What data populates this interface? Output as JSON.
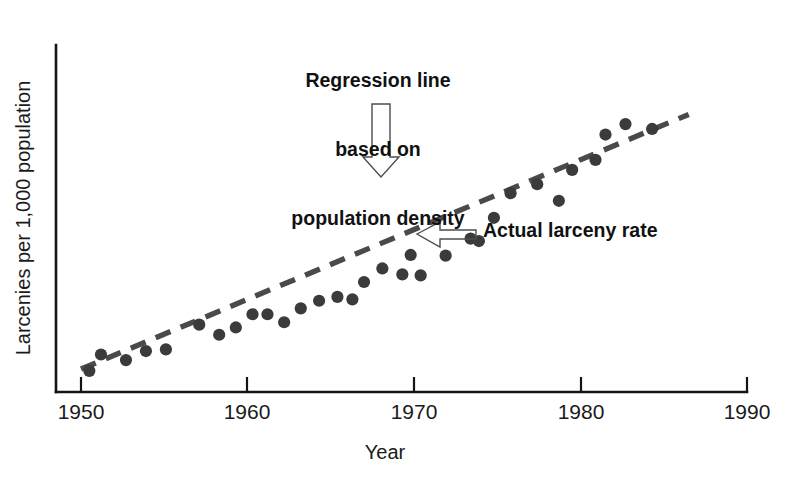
{
  "chart_data": {
    "type": "scatter",
    "title": "",
    "xlabel": "Year",
    "ylabel": "Larcenies per 1,000 population",
    "xlim": [
      1950,
      1990
    ],
    "ylim": [
      0,
      10
    ],
    "grid": false,
    "legend_position": "none",
    "x_ticks": [
      "1950",
      "1960",
      "1970",
      "1980",
      "1990"
    ],
    "x_tick_values": [
      1950,
      1960,
      1970,
      1980,
      1990
    ],
    "y_ticks": [],
    "series": [
      {
        "name": "Actual larceny rate",
        "marker": "filled-circle",
        "color": "#3b3b3b",
        "x": [
          1950.5,
          1951.2,
          1952.7,
          1953.9,
          1955.1,
          1957.1,
          1958.3,
          1959.3,
          1960.3,
          1961.2,
          1962.2,
          1963.2,
          1964.3,
          1965.4,
          1966.3,
          1967.0,
          1968.1,
          1969.3,
          1969.8,
          1970.4,
          1971.9,
          1973.4,
          1973.9,
          1974.8,
          1975.8,
          1977.4,
          1978.7,
          1979.5,
          1980.9,
          1981.5,
          1982.7,
          1984.3
        ],
        "y": [
          0.61,
          1.08,
          0.92,
          1.18,
          1.23,
          1.94,
          1.65,
          1.86,
          2.24,
          2.24,
          2.01,
          2.41,
          2.63,
          2.74,
          2.67,
          3.17,
          3.56,
          3.39,
          3.95,
          3.36,
          3.93,
          4.42,
          4.35,
          5.02,
          5.73,
          5.99,
          5.51,
          6.4,
          6.69,
          7.42,
          7.72,
          7.58
        ]
      }
    ],
    "trendline": {
      "name": "Regression line based on population density",
      "style": "dashed",
      "color": "#4a4a4a",
      "x_start": 1950.0,
      "x_end": 1986.5,
      "y_start": 0.66,
      "y_end": 8.0
    },
    "annotations": [
      {
        "id": "regression-annotation",
        "text": "Regression line\nbased on\npopulation density",
        "lines": [
          "Regression line",
          "based on",
          "population density"
        ],
        "arrow": "down",
        "arrow_color": "#b5b5b5"
      },
      {
        "id": "actual-annotation",
        "text": "Actual larceny rate",
        "arrow": "left",
        "arrow_color": "#b5b5b5"
      }
    ]
  },
  "axes": {
    "x_title": "Year",
    "y_title": "Larcenies per 1,000 population",
    "x_tick_labels": [
      {
        "label": "1950"
      },
      {
        "label": "1960"
      },
      {
        "label": "1970"
      },
      {
        "label": "1980"
      },
      {
        "label": "1990"
      }
    ]
  },
  "annotations": {
    "regression_line_1": "Regression line",
    "regression_line_2": "based on",
    "regression_line_3": "population density",
    "actual_rate": "Actual larceny rate"
  },
  "colors": {
    "background": "#ffffff",
    "axis": "#141414",
    "point": "#3b3b3b",
    "regression": "#4a4a4a",
    "arrow_fill": "#b5b5b5",
    "arrow_stroke": "#4d4d4d",
    "text": "#111111"
  }
}
